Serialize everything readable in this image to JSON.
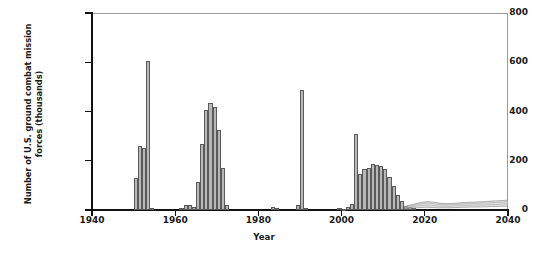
{
  "chart_data": {
    "type": "bar",
    "title": "",
    "xlabel": "Year",
    "ylabel": "Number of U.S. ground combat mission forces (thousands)",
    "xlim": [
      1940,
      2040
    ],
    "ylim": [
      0,
      800
    ],
    "xticks": [
      1940,
      1960,
      1980,
      2000,
      2020,
      2040
    ],
    "yticks": [
      0,
      200,
      400,
      600,
      800
    ],
    "grid": false,
    "legend": null,
    "bar_color": "#b8b8b8",
    "bar_edge_color": "#5a5a5a",
    "axis_color": "#111111",
    "frame_color": "#9a9a9a",
    "x": [
      1950,
      1951,
      1952,
      1953,
      1954,
      1961,
      1962,
      1963,
      1964,
      1965,
      1966,
      1967,
      1968,
      1969,
      1970,
      1971,
      1972,
      1983,
      1984,
      1989,
      1990,
      1991,
      1999,
      2000,
      2001,
      2002,
      2003,
      2004,
      2005,
      2006,
      2007,
      2008,
      2009,
      2010,
      2011,
      2012,
      2013,
      2014,
      2015,
      2016,
      2017
    ],
    "values": [
      128,
      258,
      253,
      605,
      8,
      9,
      21,
      20,
      12,
      115,
      268,
      405,
      435,
      420,
      325,
      170,
      22,
      12,
      10,
      22,
      487,
      9,
      9,
      4,
      11,
      24,
      308,
      145,
      168,
      170,
      185,
      182,
      178,
      168,
      135,
      96,
      60,
      36,
      18,
      12,
      9
    ],
    "projection": {
      "label": "projected range",
      "start_year": 2015,
      "end_year": 2040,
      "upper": [
        14,
        18,
        22,
        26,
        30,
        33,
        34,
        32,
        29,
        27,
        26,
        26,
        27,
        28,
        30,
        31,
        32,
        32,
        33,
        34,
        35,
        36,
        37,
        38,
        39,
        40
      ],
      "lower": [
        6,
        7,
        8,
        9,
        10,
        11,
        11,
        10,
        9,
        9,
        9,
        9,
        10,
        10,
        11,
        11,
        12,
        12,
        12,
        13,
        13,
        14,
        14,
        15,
        15,
        16
      ]
    }
  }
}
